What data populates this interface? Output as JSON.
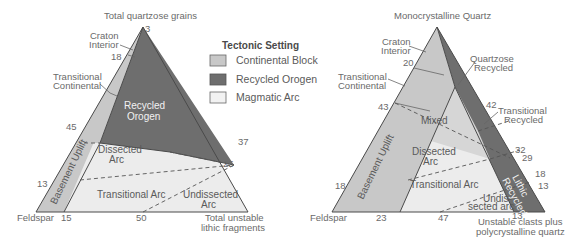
{
  "colors": {
    "continental_block": "#c8c8c8",
    "recycled_orogen": "#6e6e6e",
    "magmatic_arc": "#ececec",
    "mixed": "#d6d6d6",
    "lines": "#4a4a4a"
  },
  "legend": {
    "title": "Tectonic Setting",
    "items": [
      {
        "label": "Continental Block",
        "color": "#c8c8c8"
      },
      {
        "label": "Recycled Orogen",
        "color": "#6e6e6e"
      },
      {
        "label": "Magmatic Arc",
        "color": "#f2f2f2"
      }
    ]
  },
  "left_diagram": {
    "apex_label": "Total quartzose grains",
    "left_label": "Feldspar",
    "right_label_line1": "Total unstable",
    "right_label_line2": "lithic fragments",
    "callouts": {
      "craton_interior_1": "Craton",
      "craton_interior_2": "Interior",
      "transitional_continental_1": "Transitional",
      "transitional_continental_2": "Continental"
    },
    "regions": {
      "recycled_orogen_1": "Recycled",
      "recycled_orogen_2": "Orogen",
      "dissected_arc_1": "Dissected",
      "dissected_arc_2": "Arc",
      "transitional_arc": "Transitional Arc",
      "undissected_arc_1": "Undissected",
      "undissected_arc_2": "Arc",
      "basement_uplift": "Basement Uplift"
    },
    "ticks": {
      "apex": "3",
      "left_18": "18",
      "left_45": "45",
      "left_13": "13",
      "bottom_15": "15",
      "bottom_50": "50",
      "right_37": "37",
      "right_25": "25"
    }
  },
  "right_diagram": {
    "apex_label": "Monocrystalline Quartz",
    "left_label": "Feldspar",
    "right_label_line1": "Unstable clasts plus",
    "right_label_line2": "polycrystalline quartz",
    "callouts": {
      "craton_interior_1": "Craton",
      "craton_interior_2": "Interior",
      "transitional_continental_1": "Transitional",
      "transitional_continental_2": "Continental",
      "quartzose_recycled_1": "Quartzose",
      "quartzose_recycled_2": "Recycled",
      "transitional_recycled_1": "Transitional",
      "transitional_recycled_2": "Recycled"
    },
    "regions": {
      "mixed": "Mixed",
      "dissected_arc_1": "Dissected",
      "dissected_arc_2": "Arc",
      "transitional_arc": "Transitional Arc",
      "undissected_arc_1": "Undis-",
      "undissected_arc_2": "sected arc",
      "basement_uplift": "Basement Uplift",
      "lithic_recycled_1": "Lithic",
      "lithic_recycled_2": "Recycled"
    },
    "ticks": {
      "left_20": "20",
      "left_43": "43",
      "left_18": "18",
      "bottom_23": "23",
      "bottom_47": "47",
      "bottom_13": "13",
      "right_42": "42",
      "right_32": "32",
      "right_29": "29",
      "right_18": "18",
      "right_13": "13"
    }
  }
}
